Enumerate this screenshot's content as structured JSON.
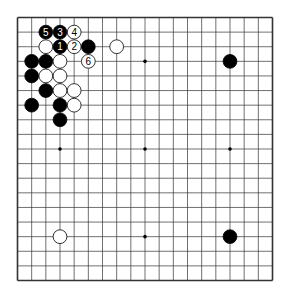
{
  "board": {
    "size": 19,
    "line_color": "#333333",
    "background": "#ffffff",
    "star_points": [
      [
        3,
        3
      ],
      [
        9,
        3
      ],
      [
        15,
        3
      ],
      [
        3,
        9
      ],
      [
        9,
        9
      ],
      [
        15,
        9
      ],
      [
        3,
        15
      ],
      [
        9,
        15
      ],
      [
        15,
        15
      ]
    ],
    "stones": [
      {
        "col": 2,
        "row": 1,
        "color": "black",
        "label": "5"
      },
      {
        "col": 3,
        "row": 1,
        "color": "black",
        "label": "3"
      },
      {
        "col": 4,
        "row": 1,
        "color": "white",
        "label": "4"
      },
      {
        "col": 2,
        "row": 2,
        "color": "white",
        "label": ""
      },
      {
        "col": 3,
        "row": 2,
        "color": "black",
        "label": "1"
      },
      {
        "col": 4,
        "row": 2,
        "color": "white",
        "label": "2"
      },
      {
        "col": 5,
        "row": 2,
        "color": "black",
        "label": ""
      },
      {
        "col": 7,
        "row": 2,
        "color": "white",
        "label": ""
      },
      {
        "col": 1,
        "row": 3,
        "color": "black",
        "label": ""
      },
      {
        "col": 2,
        "row": 3,
        "color": "black",
        "label": ""
      },
      {
        "col": 3,
        "row": 3,
        "color": "white",
        "label": ""
      },
      {
        "col": 5,
        "row": 3,
        "color": "white",
        "label": "6"
      },
      {
        "col": 15,
        "row": 3,
        "color": "black",
        "label": ""
      },
      {
        "col": 1,
        "row": 4,
        "color": "black",
        "label": ""
      },
      {
        "col": 2,
        "row": 4,
        "color": "white",
        "label": ""
      },
      {
        "col": 3,
        "row": 4,
        "color": "white",
        "label": ""
      },
      {
        "col": 2,
        "row": 5,
        "color": "black",
        "label": ""
      },
      {
        "col": 3,
        "row": 5,
        "color": "white",
        "label": ""
      },
      {
        "col": 4,
        "row": 5,
        "color": "white",
        "label": ""
      },
      {
        "col": 1,
        "row": 6,
        "color": "black",
        "label": ""
      },
      {
        "col": 3,
        "row": 6,
        "color": "black",
        "label": ""
      },
      {
        "col": 4,
        "row": 6,
        "color": "white",
        "label": ""
      },
      {
        "col": 3,
        "row": 7,
        "color": "black",
        "label": ""
      },
      {
        "col": 3,
        "row": 15,
        "color": "white",
        "label": ""
      },
      {
        "col": 15,
        "row": 15,
        "color": "black",
        "label": ""
      }
    ]
  }
}
